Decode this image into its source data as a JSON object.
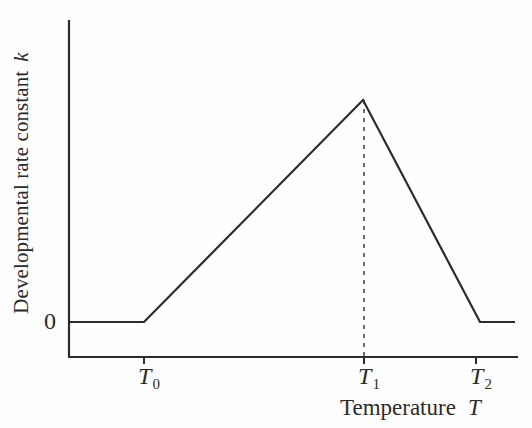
{
  "figure": {
    "background_color": "#fefefe",
    "line_color": "#2b2b2b",
    "axis_color": "#2b2b2b"
  },
  "axes": {
    "y_title_text": "Developmental rate constant",
    "y_title_variable": "k",
    "x_title_text": "Temperature",
    "x_title_variable": "T",
    "y_tick_labels": [
      "0"
    ],
    "x_tick_labels": [
      {
        "base": "T",
        "sub": "0"
      },
      {
        "base": "T",
        "sub": "1"
      },
      {
        "base": "T",
        "sub": "2"
      }
    ]
  },
  "chart_data": {
    "type": "line",
    "title": "",
    "subtitle": "",
    "xlabel": "Temperature T",
    "ylabel": "Developmental rate constant k",
    "grid": false,
    "legend": "none",
    "x_tick_labels": [
      "T0",
      "T1",
      "T2"
    ],
    "x_tick_values": [
      144,
      364,
      476
    ],
    "y_tick_labels": [
      "0"
    ],
    "y_tick_values": [
      0
    ],
    "xlim": [
      68,
      518
    ],
    "ylim": [
      0,
      1
    ],
    "series": [
      {
        "name": "Developmental rate constant k vs Temperature T",
        "x": [
          68,
          144,
          364,
          480,
          515
        ],
        "y": [
          0,
          0,
          1,
          0,
          0
        ],
        "points_px": [
          {
            "x": 68,
            "y": 322
          },
          {
            "x": 144,
            "y": 322
          },
          {
            "x": 363,
            "y": 100
          },
          {
            "x": 480,
            "y": 322
          },
          {
            "x": 515,
            "y": 322
          }
        ],
        "style": "solid",
        "width_px": 2.2,
        "color": "#2b2b2b"
      }
    ],
    "annotations": [
      {
        "name": "peak-guide-line",
        "type": "vertical-dashed",
        "x_px": 364,
        "y_top_px": 100,
        "y_bottom_px": 356,
        "color": "#4a4a4a",
        "dash": "4 5"
      }
    ]
  }
}
